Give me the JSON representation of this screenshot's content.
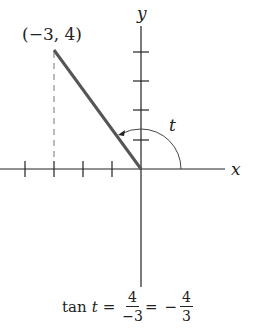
{
  "diagram": {
    "point_label": "(−3, 4)",
    "x_axis_label": "x",
    "y_axis_label": "y",
    "angle_label": "t",
    "point": {
      "x": -3,
      "y": 4
    },
    "x_ticks": [
      -4,
      -3,
      -2,
      -1
    ],
    "y_ticks": [
      1,
      2,
      3,
      4
    ],
    "colors": {
      "axis": "#222222",
      "segment": "#555555",
      "dashed": "#777777"
    }
  },
  "equation": {
    "func": "tan",
    "var": "t",
    "eq1": "=",
    "frac1_num": "4",
    "frac1_den": "−3",
    "eq2": "=",
    "neg": "−",
    "frac2_num": "4",
    "frac2_den": "3"
  }
}
